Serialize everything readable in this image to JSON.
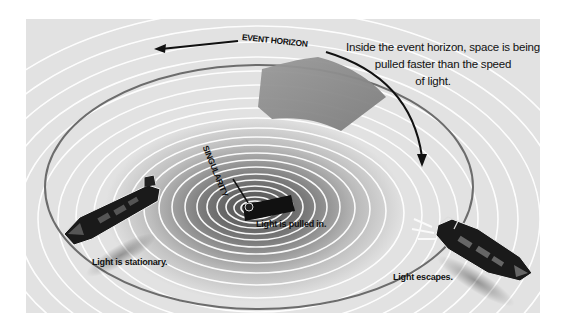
{
  "diagram": {
    "labels": {
      "event_horizon": "EVENT HORIZON",
      "singularity": "SINGULARITY",
      "note_line1": "Inside the event horizon, space is being",
      "note_line2": "pulled faster than the speed",
      "note_line3": "of light.",
      "boat_left": "Light is stationary.",
      "boat_center": "Light is pulled in.",
      "boat_right": "Light escapes."
    },
    "colors": {
      "background": "#e2e2e2",
      "ripple": "#ffffff",
      "funnel_dark": "#6e6e6e",
      "event_horizon_ring": "#707070",
      "arrow_black": "#111111",
      "gray_arrow": "#8a8a8a",
      "boat_hull": "#1a1a1a"
    },
    "elements": [
      {
        "id": "whirlpool",
        "type": "concentric-ellipses"
      },
      {
        "id": "event-horizon-ring",
        "type": "ellipse"
      },
      {
        "id": "rotation-arrow",
        "type": "curved-arrow"
      },
      {
        "id": "inflow-arrow",
        "type": "wide-gray-arrow"
      },
      {
        "id": "boat-left",
        "state": "stationary"
      },
      {
        "id": "boat-center",
        "state": "pulled-in"
      },
      {
        "id": "boat-right",
        "state": "escapes"
      }
    ]
  }
}
